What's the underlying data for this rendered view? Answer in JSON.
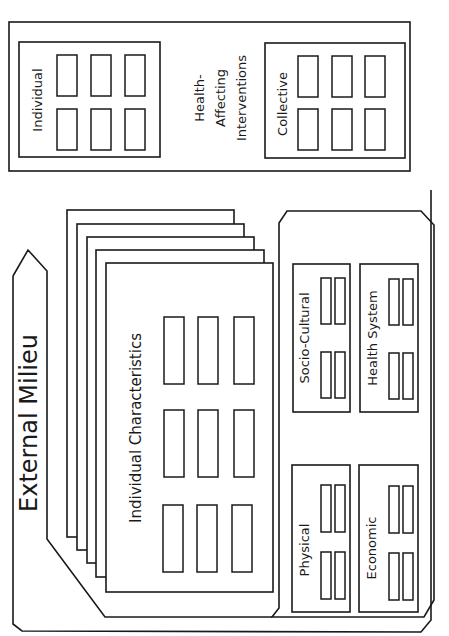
{
  "diagram": {
    "orientation": "rotated-90-ccw",
    "line_color": "#1a1a1a",
    "background": "#ffffff",
    "interventions_panel": {
      "title_lines": [
        "Health-",
        "Affecting",
        "Interventions"
      ],
      "groups": [
        {
          "label": "Individual",
          "cells_rows": 2,
          "cells_cols": 3
        },
        {
          "label": "Collective",
          "cells_rows": 2,
          "cells_cols": 3
        }
      ]
    },
    "external_milieu": {
      "label": "External Milieu"
    },
    "individual_stack": {
      "label": "Individual Characteristics",
      "stacked_pages": 5,
      "cells_rows": 3,
      "cells_cols": 3
    },
    "environment_panel": {
      "groups": [
        {
          "label": "Socio-Cultural"
        },
        {
          "label": "Health System"
        },
        {
          "label": "Physical"
        },
        {
          "label": "Economic"
        }
      ]
    }
  }
}
